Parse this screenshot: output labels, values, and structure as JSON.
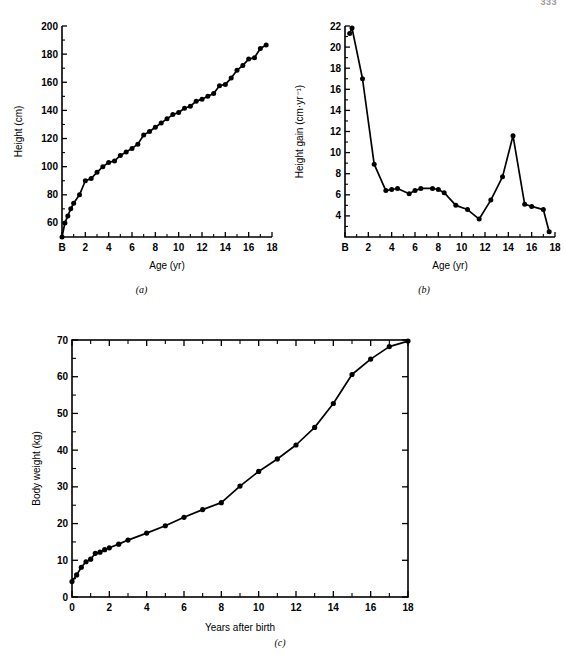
{
  "page": {
    "number": "333"
  },
  "figure": {
    "panels": [
      {
        "id": "a",
        "caption": "(a)"
      },
      {
        "id": "b",
        "caption": "(b)"
      },
      {
        "id": "c",
        "caption": "(c)"
      }
    ]
  },
  "chart_data": [
    {
      "type": "line",
      "panel": "a",
      "title": "",
      "xlabel": "Age (yr)",
      "ylabel": "Height (cm)",
      "xlim": [
        0,
        18
      ],
      "ylim": [
        50,
        200
      ],
      "grid": false,
      "legend": null,
      "xticks": [
        0,
        2,
        4,
        6,
        8,
        10,
        12,
        14,
        16,
        18
      ],
      "xticklabels": [
        "B",
        "2",
        "4",
        "6",
        "8",
        "10",
        "12",
        "14",
        "16",
        "18"
      ],
      "xtick_minor": [
        1,
        3,
        5,
        7,
        9,
        11,
        13,
        15,
        17
      ],
      "yticks": [
        60,
        80,
        100,
        120,
        140,
        160,
        180,
        200
      ],
      "yticklabels": [
        "60",
        "80",
        "100",
        "120",
        "140",
        "160",
        "180",
        "200"
      ],
      "ytick_minor": [
        70,
        90,
        110,
        130,
        150,
        170,
        190
      ],
      "x": [
        0,
        0.25,
        0.5,
        0.75,
        1,
        1.5,
        2,
        2.5,
        3,
        3.5,
        4,
        4.5,
        5,
        5.5,
        6,
        6.5,
        7,
        7.5,
        8,
        8.5,
        9,
        9.5,
        10,
        10.5,
        11,
        11.5,
        12,
        12.5,
        13,
        13.5,
        14,
        14.5,
        15,
        15.5,
        16,
        16.5,
        17,
        17.5
      ],
      "y": [
        50,
        60,
        65,
        70,
        74,
        80,
        90,
        91.5,
        96,
        100,
        103,
        104,
        108,
        110.5,
        113,
        116,
        122.5,
        125,
        128,
        131,
        134,
        137,
        138.5,
        141.5,
        143,
        146.5,
        148,
        150,
        152,
        157.5,
        158.5,
        163,
        168.5,
        172,
        176.5,
        177.5,
        184,
        186.5,
        188
      ]
    },
    {
      "type": "line",
      "panel": "b",
      "title": "",
      "xlabel": "Age (yr)",
      "ylabel": "Height gain (cm·yr⁻¹)",
      "xlim": [
        0,
        18
      ],
      "ylim": [
        2,
        22
      ],
      "grid": false,
      "legend": null,
      "xticks": [
        0,
        2,
        4,
        6,
        8,
        10,
        12,
        14,
        16,
        18
      ],
      "xticklabels": [
        "B",
        "2",
        "4",
        "6",
        "8",
        "10",
        "12",
        "14",
        "16",
        "18"
      ],
      "xtick_minor": [
        1,
        3,
        5,
        7,
        9,
        11,
        13,
        15,
        17
      ],
      "yticks": [
        4,
        6,
        8,
        10,
        12,
        14,
        16,
        18,
        20,
        22
      ],
      "yticklabels": [
        "4",
        "6",
        "8",
        "10",
        "12",
        "14",
        "16",
        "18",
        "20",
        "22"
      ],
      "ytick_minor": [
        3,
        5,
        7,
        9,
        11,
        13,
        15,
        17,
        19,
        21
      ],
      "x": [
        0.4,
        0.6,
        1.5,
        2.5,
        3.5,
        4.0,
        4.5,
        5.5,
        6.0,
        6.5,
        7.5,
        8.0,
        8.5,
        9.5,
        10.5,
        11.5,
        12.5,
        13.5,
        14.4,
        15.4,
        16.0,
        17.0,
        17.5
      ],
      "y": [
        21.3,
        21.8,
        17.0,
        8.9,
        6.4,
        6.5,
        6.6,
        6.1,
        6.4,
        6.6,
        6.6,
        6.5,
        6.2,
        5.0,
        4.6,
        3.7,
        5.5,
        7.7,
        11.6,
        5.1,
        4.9,
        4.6,
        2.5
      ]
    },
    {
      "type": "line",
      "panel": "c",
      "title": "",
      "xlabel": "Years after birth",
      "ylabel": "Body weight (kg)",
      "xlim": [
        0,
        18
      ],
      "ylim": [
        0,
        70
      ],
      "grid": false,
      "legend": null,
      "frame": true,
      "xticks": [
        0,
        2,
        4,
        6,
        8,
        10,
        12,
        14,
        16,
        18
      ],
      "xticklabels": [
        "0",
        "2",
        "4",
        "6",
        "8",
        "10",
        "12",
        "14",
        "16",
        "18"
      ],
      "xtick_minor": [
        1,
        3,
        5,
        7,
        9,
        11,
        13,
        15,
        17
      ],
      "yticks": [
        0,
        10,
        20,
        30,
        40,
        50,
        60,
        70
      ],
      "yticklabels": [
        "0",
        "10",
        "20",
        "30",
        "40",
        "50",
        "60",
        "70"
      ],
      "ytick_minor": [
        5,
        15,
        25,
        35,
        45,
        55,
        65
      ],
      "x": [
        0,
        0.25,
        0.5,
        0.75,
        1,
        1.25,
        1.5,
        1.75,
        2,
        2.5,
        3,
        4,
        5,
        6,
        7,
        8,
        9,
        10,
        11,
        12,
        13,
        14,
        15,
        16,
        17,
        18
      ],
      "y": [
        4.2,
        6.0,
        8.1,
        9.6,
        10.3,
        11.9,
        12.2,
        12.9,
        13.4,
        14.4,
        15.5,
        17.4,
        19.4,
        21.7,
        23.8,
        25.7,
        30.2,
        34.2,
        37.6,
        41.4,
        46.2,
        52.7,
        60.6,
        64.8,
        68.2,
        69.7
      ]
    }
  ]
}
